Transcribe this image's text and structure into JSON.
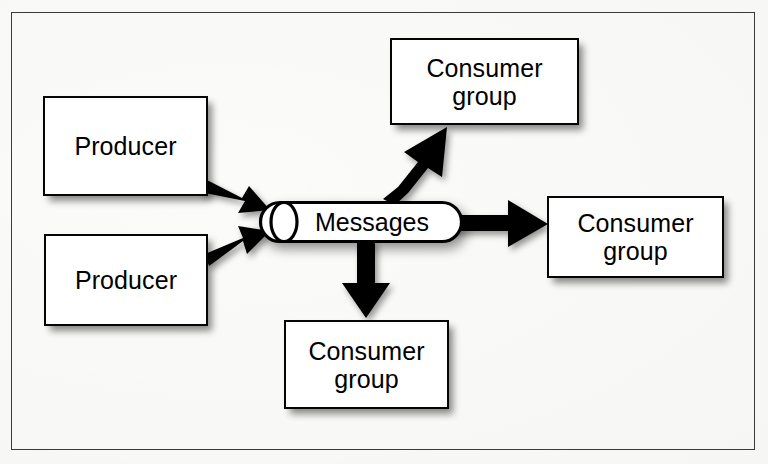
{
  "diagram": {
    "background_color": "#fbfbf9",
    "stroke_color": "#000000",
    "frame_color": "#3a3a3a",
    "node_fill": "#ffffff",
    "nodes": {
      "producer_1": {
        "label": "Producer",
        "shape": "rectangle"
      },
      "producer_2": {
        "label": "Producer",
        "shape": "rectangle"
      },
      "queue": {
        "label": "Messages",
        "shape": "cylinder"
      },
      "consumer_group_top": {
        "label": "Consumer\ngroup",
        "shape": "rectangle"
      },
      "consumer_group_right": {
        "label": "Consumer\ngroup",
        "shape": "rectangle"
      },
      "consumer_group_bottom": {
        "label": "Consumer\ngroup",
        "shape": "rectangle"
      }
    },
    "edges": [
      {
        "name": "producer-1-to-queue",
        "from": "producer_1",
        "to": "queue",
        "direction": "down-right"
      },
      {
        "name": "producer-2-to-queue",
        "from": "producer_2",
        "to": "queue",
        "direction": "up-right"
      },
      {
        "name": "queue-to-consumer-top",
        "from": "queue",
        "to": "consumer_group_top",
        "direction": "up-right"
      },
      {
        "name": "queue-to-consumer-right",
        "from": "queue",
        "to": "consumer_group_right",
        "direction": "right"
      },
      {
        "name": "queue-to-consumer-bottom",
        "from": "queue",
        "to": "consumer_group_bottom",
        "direction": "down"
      }
    ]
  }
}
